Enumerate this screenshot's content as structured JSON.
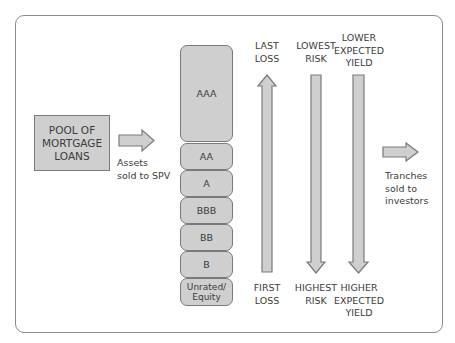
{
  "pool": {
    "label": "POOL OF\nMORTGAGE\nLOANS"
  },
  "assets_label": "Assets\nsold to SPV",
  "tranches": [
    {
      "label": "AAA"
    },
    {
      "label": "AA"
    },
    {
      "label": "A"
    },
    {
      "label": "BBB"
    },
    {
      "label": "BB"
    },
    {
      "label": "B"
    },
    {
      "label": "Unrated/\nEquity"
    }
  ],
  "columns": [
    {
      "top": "LAST\nLOSS",
      "bottom": "FIRST\nLOSS",
      "direction": "up"
    },
    {
      "top": "LOWEST\nRISK",
      "bottom": "HIGHEST\nRISK",
      "direction": "down"
    },
    {
      "top": "LOWER\nEXPECTED\nYIELD",
      "bottom": "HIGHER\nEXPECTED\nYIELD",
      "direction": "down"
    }
  ],
  "investors_label": "Tranches\nsold to\ninvestors",
  "colors": {
    "fill": "#cfcfcf",
    "stroke": "#7a7a7a",
    "frame": "#8c8c8c",
    "text": "#3c3c3c"
  }
}
